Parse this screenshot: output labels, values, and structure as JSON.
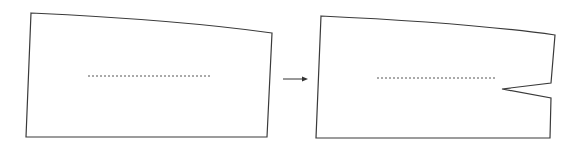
{
  "diagram": {
    "type": "before-after pattern alteration",
    "colors": {
      "outline": "#3a3a3a",
      "dashed_line": "#555555",
      "arrow": "#333333",
      "background": "#ffffff"
    },
    "before_shape": {
      "description": "Quadrilateral pattern piece with slightly curved top edge and a horizontal dashed guide line",
      "points": [
        [
          31,
          13
        ],
        [
          150,
          20
        ],
        [
          230,
          27
        ],
        [
          272,
          33
        ],
        [
          267,
          137
        ],
        [
          26,
          137
        ]
      ],
      "dashed_line": {
        "x1": 88,
        "y1": 76,
        "x2": 211,
        "y2": 76
      }
    },
    "arrow": {
      "x1": 283,
      "y1": 79,
      "x2": 308,
      "y2": 79,
      "direction": "right"
    },
    "after_shape": {
      "description": "Same pattern piece with a dart (wedge notch) cut into the right edge at the end of the dashed line",
      "points": [
        [
          321,
          16
        ],
        [
          440,
          23
        ],
        [
          520,
          29
        ],
        [
          555,
          35
        ],
        [
          551,
          83
        ],
        [
          502,
          89
        ],
        [
          551,
          98
        ],
        [
          550,
          138
        ],
        [
          316,
          138
        ]
      ],
      "dashed_line": {
        "x1": 377,
        "y1": 78,
        "x2": 496,
        "y2": 78
      },
      "dart": {
        "upper": [
          551,
          83
        ],
        "tip": [
          502,
          89
        ],
        "lower": [
          551,
          98
        ]
      }
    }
  }
}
